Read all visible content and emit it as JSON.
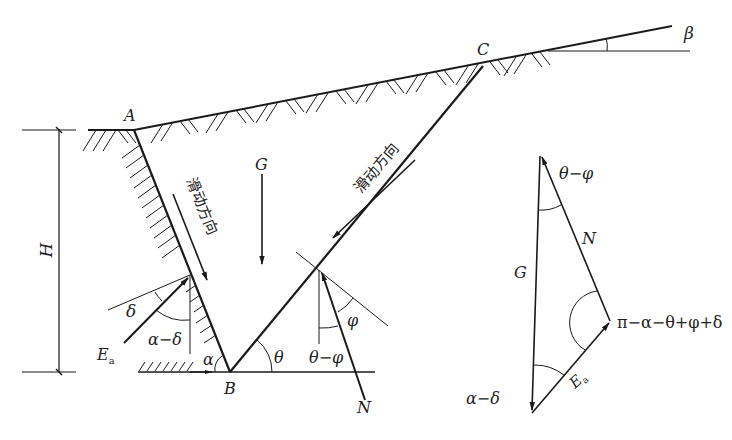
{
  "diagram": {
    "type": "coulomb-active-earth-pressure",
    "points": {
      "A": "A",
      "B": "B",
      "C": "C"
    },
    "labels": {
      "height": "H",
      "weight": "G",
      "reaction": "N",
      "earth_pressure": "E",
      "earth_pressure_sub": "a",
      "beta": "β",
      "alpha": "α",
      "theta": "θ",
      "phi": "φ",
      "delta": "δ",
      "alpha_minus_delta": "α−δ",
      "theta_minus_phi": "θ−φ",
      "sliding_direction": "滑动方向"
    },
    "force_triangle": {
      "G": "G",
      "N": "N",
      "E": "E",
      "E_sub": "a",
      "angle_top": "θ−φ",
      "angle_right": "π−α−θ+φ+δ",
      "angle_bottom": "α−δ"
    },
    "colors": {
      "line": "#1a1a1a",
      "background": "#ffffff"
    }
  }
}
